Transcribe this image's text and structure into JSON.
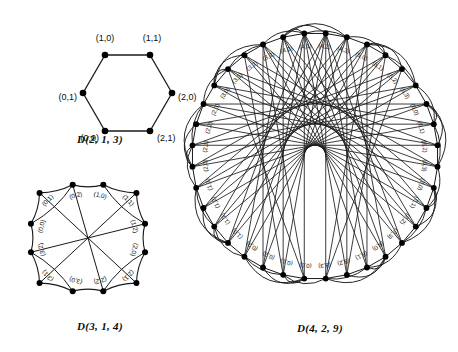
{
  "figure": {
    "background": "#ffffff",
    "ink": "#111111",
    "vertex_color": "#000000",
    "edge_color": "#1a1a1a"
  },
  "panels": [
    {
      "id": "d213",
      "caption": "D(2, 1, 3)",
      "shape": "hexagon",
      "n_vertices": 6,
      "labels": [
        "(1,0)",
        "(1,1)",
        "(2,0)",
        "(2,1)",
        "(0,0)",
        "(0,1)"
      ],
      "vertex_labels": [
        {
          "text": "(1,0)",
          "vx": 105,
          "vy": 55,
          "lx": 105,
          "ly": 38,
          "anchor": "middle",
          "rot": 0
        },
        {
          "text": "(1,1)",
          "vx": 150,
          "vy": 55,
          "lx": 152,
          "ly": 38,
          "anchor": "middle",
          "rot": 0
        },
        {
          "text": "(2,0)",
          "vx": 172,
          "vy": 93,
          "lx": 178,
          "ly": 101,
          "anchor": "start",
          "rot": 0
        },
        {
          "text": "(2,1)",
          "vx": 150,
          "vy": 131,
          "lx": 157,
          "ly": 140,
          "anchor": "start",
          "rot": 0
        },
        {
          "text": "(0,0)",
          "vx": 105,
          "vy": 131,
          "lx": 98,
          "ly": 140,
          "anchor": "end",
          "rot": 0
        },
        {
          "text": "(0,1)",
          "vx": 83,
          "vy": 93,
          "lx": 76,
          "ly": 101,
          "anchor": "end",
          "rot": 0
        }
      ]
    },
    {
      "id": "d314",
      "caption": "D(3, 1, 4)",
      "shape": "rounded-square",
      "n_vertices": 12,
      "groups": 4,
      "per_group": 3,
      "labels": [
        "(1,0)",
        "(1,1)",
        "(1,2)",
        "(2,0)",
        "(2,1)",
        "(2,2)",
        "(3,0)",
        "(3,1)",
        "(3,2)",
        "(0,0)",
        "(0,1)",
        "(0,2)"
      ]
    },
    {
      "id": "d429",
      "caption": "D(4, 2, 9)",
      "shape": "circle",
      "n_vertices": 36,
      "groups": 9,
      "per_group": 4,
      "labels": [
        "(0,0)",
        "(0,1)",
        "(0,2)",
        "(0,3)",
        "(1,0)",
        "(1,1)",
        "(1,2)",
        "(1,3)",
        "(2,0)",
        "(2,1)",
        "(2,2)",
        "(2,3)",
        "(3,0)",
        "(3,1)",
        "(3,2)",
        "(3,3)",
        "(4,0)",
        "(4,1)",
        "(4,2)",
        "(4,3)",
        "(5,0)",
        "(5,1)",
        "(5,2)",
        "(5,3)",
        "(6,0)",
        "(6,1)",
        "(6,2)",
        "(6,3)",
        "(7,0)",
        "(7,1)",
        "(7,2)",
        "(7,3)",
        "(8,0)",
        "(8,1)",
        "(8,2)",
        "(8,3)"
      ]
    }
  ],
  "chart_data": {
    "type": "diagram",
    "title": "",
    "diagrams": [
      {
        "name": "D(2, 1, 3)",
        "parameters": {
          "d": 2,
          "k": 1,
          "n": 3
        },
        "vertices": [
          "(0,0)",
          "(0,1)",
          "(1,0)",
          "(1,1)",
          "(2,0)",
          "(2,1)"
        ],
        "edges": [
          [
            "(1,0)",
            "(1,1)"
          ],
          [
            "(1,1)",
            "(2,0)"
          ],
          [
            "(2,0)",
            "(2,1)"
          ],
          [
            "(2,1)",
            "(0,0)"
          ],
          [
            "(0,0)",
            "(0,1)"
          ],
          [
            "(0,1)",
            "(1,0)"
          ]
        ]
      },
      {
        "name": "D(3, 1, 4)",
        "parameters": {
          "d": 3,
          "k": 1,
          "n": 4
        },
        "vertices": [
          "(0,0)",
          "(0,1)",
          "(0,2)",
          "(1,0)",
          "(1,1)",
          "(1,2)",
          "(2,0)",
          "(2,1)",
          "(2,2)",
          "(3,0)",
          "(3,1)",
          "(3,2)"
        ]
      },
      {
        "name": "D(4, 2, 9)",
        "parameters": {
          "d": 4,
          "k": 2,
          "n": 9
        },
        "vertex_count": 36,
        "group_count": 9,
        "vertices_per_group": 4
      }
    ]
  }
}
